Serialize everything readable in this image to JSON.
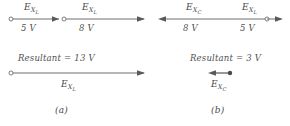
{
  "figure": {
    "type": "phasor-vector-addition-diagram",
    "style": "hand-drawn line diagram, gray ink on white"
  },
  "panel_a": {
    "caption": "(a)",
    "vectors": [
      {
        "symbol_base": "E",
        "symbol_sub": "X",
        "symbol_sub2": "L",
        "magnitude": "5 V",
        "direction": "right"
      },
      {
        "symbol_base": "E",
        "symbol_sub": "X",
        "symbol_sub2": "L",
        "magnitude": "8 V",
        "direction": "right"
      }
    ],
    "resultant": {
      "text": "Resultant = 13 V",
      "symbol_base": "E",
      "symbol_sub": "X",
      "symbol_sub2": "L",
      "direction": "right"
    }
  },
  "panel_b": {
    "caption": "(b)",
    "vectors": [
      {
        "symbol_base": "E",
        "symbol_sub": "X",
        "symbol_sub2": "C",
        "magnitude": "8 V",
        "direction": "left"
      },
      {
        "symbol_base": "E",
        "symbol_sub": "X",
        "symbol_sub2": "L",
        "magnitude": "5 V",
        "direction": "right"
      }
    ],
    "resultant": {
      "text": "Resultant = 3 V",
      "symbol_base": "E",
      "symbol_sub": "X",
      "symbol_sub2": "C",
      "direction": "left"
    }
  },
  "colors": {
    "ink": "#5a5a5a",
    "text": "#4a4a4a",
    "background": "#ffffff"
  }
}
